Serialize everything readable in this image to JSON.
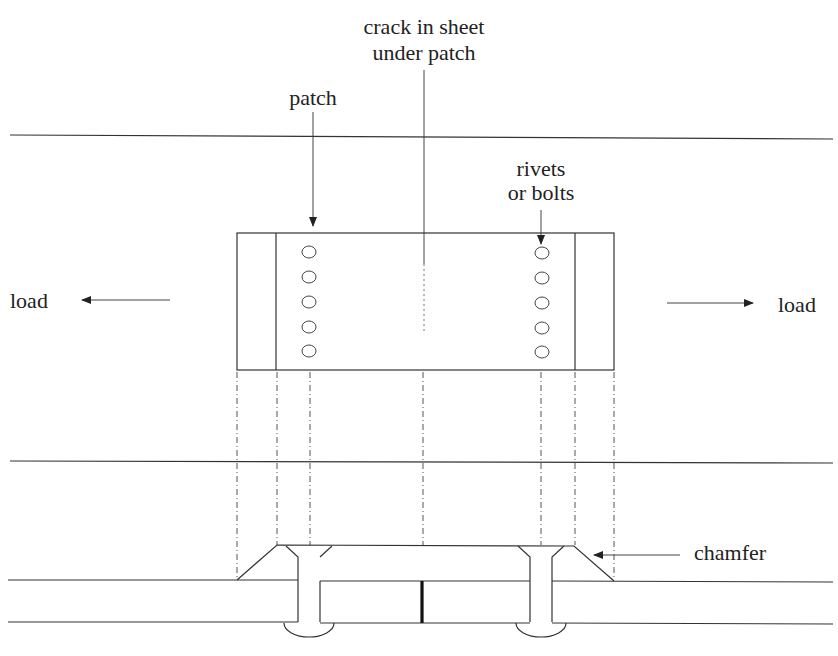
{
  "diagram": {
    "labels": {
      "crack_line1": "crack in sheet",
      "crack_line2": "under patch",
      "patch": "patch",
      "rivets_line1": "rivets",
      "rivets_line2": "or bolts",
      "load_left": "load",
      "load_right": "load",
      "chamfer": "chamfer"
    },
    "rivet_count_per_row": 5,
    "colors": {
      "line": "#333333",
      "crack": "#111111",
      "background": "#ffffff"
    }
  }
}
